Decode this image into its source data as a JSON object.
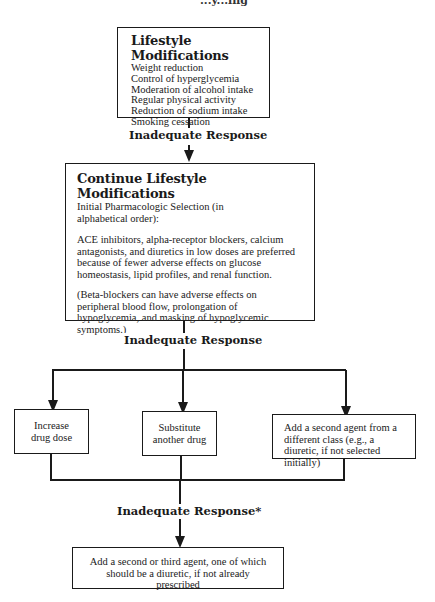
{
  "header": {
    "fragment": "...y...ing"
  },
  "nodes": {
    "lifestyle": {
      "title": "Lifestyle Modifications",
      "items": [
        "Weight reduction",
        "Control of hyperglycemia",
        "Moderation of alcohol intake",
        "Regular physical activity",
        "Reduction of sodium intake",
        "Smoking cessation"
      ]
    },
    "continue": {
      "title": "Continue Lifestyle Modifications",
      "subtitle": "Initial Pharmacologic Selection (in alphabetical order):",
      "paragraph1": "ACE inhibitors, alpha-receptor blockers, calcium antagonists, and diuretics in low doses are preferred because of fewer adverse effects on glucose homeostasis, lipid profiles, and renal function.",
      "paragraph2": "(Beta-blockers can have adverse effects on peripheral blood flow, prolongation of hypoglycemia, and masking of hypoglycemic symptoms.)"
    },
    "increase_dose": {
      "text_line1": "Increase",
      "text_line2": "drug dose"
    },
    "substitute": {
      "text_line1": "Substitute",
      "text_line2": "another drug"
    },
    "second_agent": {
      "text": "Add a second agent from a different class (e.g., a diuretic, if not selected initially)"
    },
    "final": {
      "text": "Add a second or third agent, one of which should be a diuretic, if not already prescribed"
    }
  },
  "edges": {
    "label1": "Inadequate Response",
    "label2": "Inadequate Response",
    "label3": "Inadequate Response*"
  }
}
